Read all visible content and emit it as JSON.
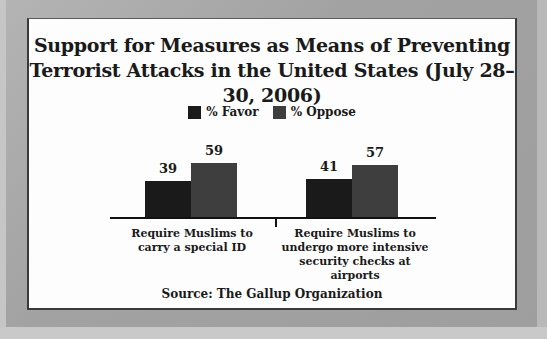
{
  "chart_data": {
    "type": "bar",
    "title": "Support for Measures as Means of Preventing Terrorist Attacks in the United States (July 28–30, 2006)",
    "title_lines": [
      "Support for Measures as Means of Preventing",
      "Terrorist Attacks in the United States (July 28–30, 2006)"
    ],
    "categories": [
      "Require Muslims to carry a special ID",
      "Require Muslims to undergo more intensive security checks at airports"
    ],
    "category_label_lines": [
      "Require Muslims to\ncarry a special ID",
      "Require Muslims to\nundergo more intensive\nsecurity checks at airports"
    ],
    "series": [
      {
        "name": "% Favor",
        "values": [
          39,
          41
        ],
        "color": "#1a1a1a"
      },
      {
        "name": "% Oppose",
        "values": [
          59,
          57
        ],
        "color": "#3e3e3e"
      }
    ],
    "xlabel": "",
    "ylabel": "",
    "ylim": [
      0,
      100
    ],
    "grid": false,
    "legend_position": "top",
    "data_labels": true,
    "source": "Source: The Gallup Organization"
  }
}
